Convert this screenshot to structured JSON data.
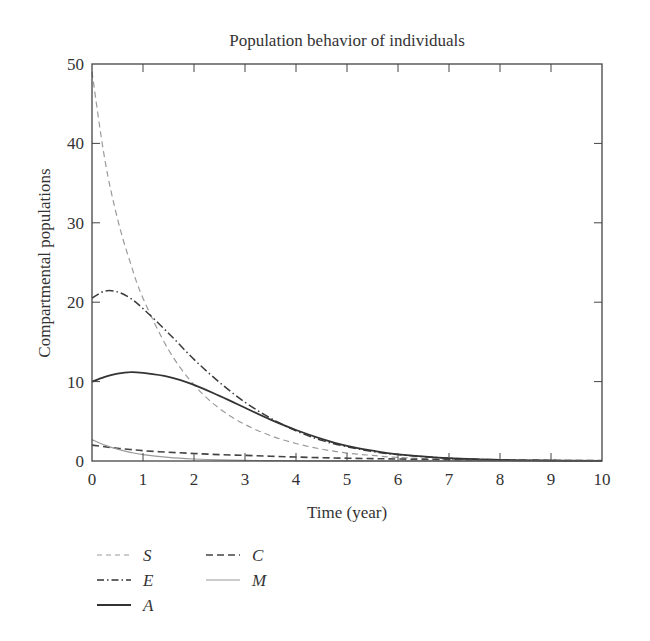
{
  "chart_data": {
    "type": "line",
    "title": "Population behavior of individuals",
    "xlabel": "Time (year)",
    "ylabel": "Compartmental populations",
    "xlim": [
      0,
      10
    ],
    "ylim": [
      0,
      50
    ],
    "xticks": [
      0,
      1,
      2,
      3,
      4,
      5,
      6,
      7,
      8,
      9,
      10
    ],
    "yticks": [
      0,
      10,
      20,
      30,
      40,
      50
    ],
    "grid": false,
    "legend_position": "below-left",
    "x": [
      0,
      0.25,
      0.5,
      0.75,
      1,
      1.5,
      2,
      2.5,
      3,
      3.5,
      4,
      4.5,
      5,
      5.5,
      6,
      7,
      8,
      9,
      10
    ],
    "series": [
      {
        "name": "S",
        "style": "dashed-light",
        "color": "#999999",
        "values": [
          49,
          38,
          30.5,
          25,
          20.5,
          14,
          9.6,
          6.6,
          4.6,
          3.2,
          2.2,
          1.5,
          1.0,
          0.7,
          0.45,
          0.2,
          0.08,
          0.03,
          0.01
        ]
      },
      {
        "name": "E",
        "style": "dash-dot",
        "color": "#333333",
        "values": [
          20.5,
          21.4,
          21.3,
          20.5,
          19.2,
          16.1,
          12.8,
          9.9,
          7.4,
          5.4,
          3.8,
          2.6,
          1.8,
          1.2,
          0.8,
          0.35,
          0.15,
          0.06,
          0.02
        ]
      },
      {
        "name": "A",
        "style": "solid-dark",
        "color": "#333333",
        "values": [
          10,
          10.6,
          11.0,
          11.2,
          11.1,
          10.6,
          9.6,
          8.2,
          6.7,
          5.2,
          3.9,
          2.8,
          1.9,
          1.3,
          0.85,
          0.35,
          0.14,
          0.05,
          0.02
        ]
      },
      {
        "name": "C",
        "style": "dashed-dark",
        "color": "#333333",
        "values": [
          2.0,
          1.8,
          1.6,
          1.45,
          1.3,
          1.1,
          0.95,
          0.8,
          0.7,
          0.6,
          0.5,
          0.42,
          0.35,
          0.3,
          0.25,
          0.17,
          0.12,
          0.08,
          0.05
        ]
      },
      {
        "name": "M",
        "style": "solid-light",
        "color": "#999999",
        "values": [
          2.7,
          2.0,
          1.5,
          1.1,
          0.8,
          0.45,
          0.25,
          0.14,
          0.08,
          0.05,
          0.03,
          0.02,
          0.01,
          0.0,
          0.0,
          0.0,
          0.0,
          0.0,
          0.0
        ]
      }
    ]
  },
  "legend": {
    "items": [
      {
        "label": "S"
      },
      {
        "label": "E"
      },
      {
        "label": "A"
      },
      {
        "label": "C"
      },
      {
        "label": "M"
      }
    ]
  }
}
